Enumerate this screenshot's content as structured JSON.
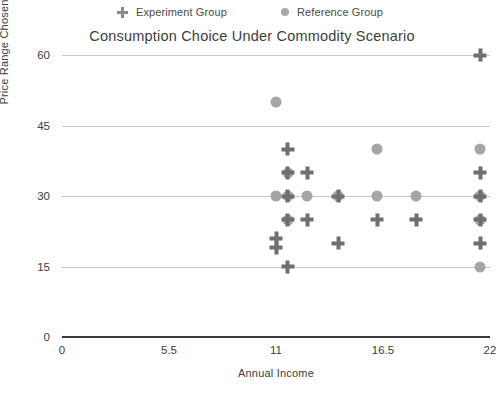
{
  "chart_data": {
    "type": "scatter",
    "title": "Consumption Choice Under Commodity Scenario",
    "xlabel": "Annual Income",
    "ylabel": "Price Range Chosen",
    "xlim": [
      0,
      22
    ],
    "ylim": [
      0,
      60
    ],
    "xticks": [
      "0",
      "5.5",
      "11",
      "16.5",
      "22"
    ],
    "xtick_values": [
      0,
      5.5,
      11,
      16.5,
      22
    ],
    "yticks": [
      "0",
      "15",
      "30",
      "45",
      "60"
    ],
    "ytick_values": [
      0,
      15,
      30,
      45,
      60
    ],
    "grid": "horizontal",
    "legend_position": "above-title",
    "series": [
      {
        "name": "Experiment Group",
        "marker": "plus",
        "color": "#6f6f6f",
        "points": [
          {
            "x": 11.0,
            "y": 21
          },
          {
            "x": 11.0,
            "y": 19
          },
          {
            "x": 11.6,
            "y": 40
          },
          {
            "x": 11.6,
            "y": 35
          },
          {
            "x": 11.6,
            "y": 30
          },
          {
            "x": 11.6,
            "y": 25
          },
          {
            "x": 11.6,
            "y": 15
          },
          {
            "x": 12.6,
            "y": 35
          },
          {
            "x": 12.6,
            "y": 25
          },
          {
            "x": 14.2,
            "y": 30
          },
          {
            "x": 14.2,
            "y": 20
          },
          {
            "x": 16.2,
            "y": 25
          },
          {
            "x": 18.2,
            "y": 25
          },
          {
            "x": 21.5,
            "y": 60
          },
          {
            "x": 21.5,
            "y": 35
          },
          {
            "x": 21.5,
            "y": 30
          },
          {
            "x": 21.5,
            "y": 25
          },
          {
            "x": 21.5,
            "y": 20
          }
        ]
      },
      {
        "name": "Reference Group",
        "marker": "circle",
        "color": "#a5a5a5",
        "points": [
          {
            "x": 11.0,
            "y": 50
          },
          {
            "x": 11.0,
            "y": 30
          },
          {
            "x": 11.6,
            "y": 35
          },
          {
            "x": 11.6,
            "y": 30
          },
          {
            "x": 11.6,
            "y": 25
          },
          {
            "x": 12.6,
            "y": 30
          },
          {
            "x": 14.2,
            "y": 30
          },
          {
            "x": 16.2,
            "y": 40
          },
          {
            "x": 16.2,
            "y": 30
          },
          {
            "x": 18.2,
            "y": 30
          },
          {
            "x": 21.5,
            "y": 40
          },
          {
            "x": 21.5,
            "y": 30
          },
          {
            "x": 21.5,
            "y": 25
          },
          {
            "x": 21.5,
            "y": 15
          }
        ]
      }
    ]
  },
  "legend": {
    "experiment_label": "Experiment Group",
    "reference_label": "Reference Group",
    "experiment_icon": "plus-marker-icon",
    "reference_icon": "circle-marker-icon"
  },
  "colors": {
    "experiment": "#6f6f6f",
    "reference": "#a5a5a5",
    "grid": "#c9c9c9",
    "axis": "#3a3a3a",
    "text": "#3d3d3d",
    "background": "#ffffff"
  }
}
